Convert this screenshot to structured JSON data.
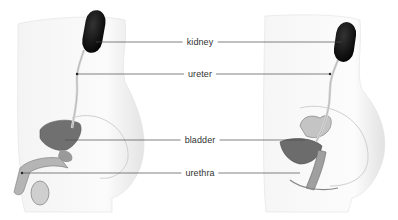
{
  "diagram": {
    "figures": [
      {
        "id": "male",
        "side": "left"
      },
      {
        "id": "female",
        "side": "right"
      }
    ],
    "labels": [
      {
        "text": "kidney",
        "y": 42,
        "left_x": 96,
        "right_x": 342
      },
      {
        "text": "ureter",
        "y": 74,
        "left_x": 77,
        "right_x": 330
      },
      {
        "text": "bladder",
        "y": 140,
        "left_x": 65,
        "right_x": 305
      },
      {
        "text": "urethra",
        "y": 173,
        "left_x": 22,
        "right_x": 300
      }
    ],
    "colors": {
      "line": "#4a4a4a",
      "label_text": "#333333",
      "kidney": "#111111",
      "body_shade": "#eeeeee",
      "organ": "#6a6a6a"
    }
  }
}
